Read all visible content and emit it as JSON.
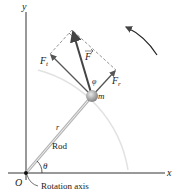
{
  "diagram": {
    "axes": {
      "x_label": "x",
      "y_label": "y",
      "origin_label": "O"
    },
    "labels": {
      "mass": "m",
      "radius": "r",
      "rod": "Rod",
      "angle_theta": "θ",
      "angle_phi": "φ",
      "force": "F",
      "force_tangential": "F",
      "force_tangential_sub": "t",
      "force_radial": "F",
      "force_radial_sub": "r",
      "rotation_axis": "Rotation axis"
    },
    "colors": {
      "axis": "#333333",
      "rod": "#a8a8a8",
      "force_main": "#444444",
      "force_component": "#555555",
      "dashed": "#777777",
      "arc": "#dddddd",
      "mass": "#9a9a9a"
    }
  }
}
